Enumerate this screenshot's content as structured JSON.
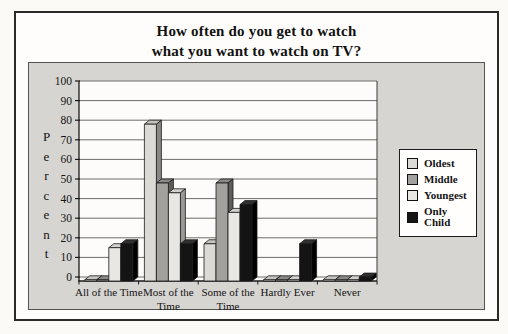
{
  "figure": {
    "title_line1": "How often do you get to watch",
    "title_line2": "what you want to watch on TV?"
  },
  "chart_data": {
    "type": "bar",
    "style": "3d-clustered-grayscale",
    "title": "How often do you get to watch what you want to watch on TV?",
    "xlabel": "",
    "ylabel": "Percent",
    "ylim": [
      0,
      100
    ],
    "ytick_interval": 10,
    "grid": true,
    "legend_position": "right",
    "legend_entries": [
      "Oldest",
      "Middle",
      "Youngest",
      "Only Child"
    ],
    "categories": [
      "All of the Time",
      "Most of the Time",
      "Some of the Time",
      "Hardly Ever",
      "Never"
    ],
    "category_label_lines": [
      [
        "All of the Time"
      ],
      [
        "Most of the",
        "Time"
      ],
      [
        "Some of the",
        "Time"
      ],
      [
        "Hardly Ever"
      ],
      [
        "Never"
      ]
    ],
    "series": [
      {
        "name": "Oldest",
        "values": [
          0,
          80,
          19,
          0,
          0
        ],
        "front": "#dcdad5",
        "side": "#8a8885",
        "top": "#c6c4bf"
      },
      {
        "name": "Middle",
        "values": [
          0,
          50,
          50,
          0,
          0
        ],
        "front": "#a3a19e",
        "side": "#5f5d5b",
        "top": "#8b8987"
      },
      {
        "name": "Youngest",
        "values": [
          17,
          45,
          35,
          0,
          0
        ],
        "front": "#e9e7e3",
        "side": "#9b9995",
        "top": "#d3d1cd"
      },
      {
        "name": "Only Child",
        "values": [
          19,
          19,
          39,
          19,
          2
        ],
        "front": "#141414",
        "side": "#000000",
        "top": "#303030"
      }
    ],
    "colors": {
      "panel_background": "#d7d5d1",
      "plot_background": "#fdfcfa",
      "gridline": "#6e6c69",
      "axis": "#1a1a1a"
    }
  }
}
